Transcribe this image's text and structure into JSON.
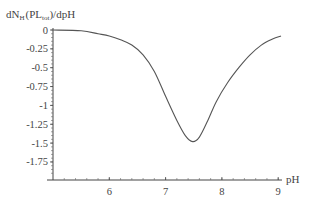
{
  "chart_data": {
    "type": "line",
    "title": "",
    "ylabel": "dN_H(PL_tot)/dpH",
    "ylabel_main": "dN",
    "ylabel_sub": "H",
    "ylabel_mid": "(PL",
    "ylabel_sub2": "tot",
    "ylabel_end": ")/dpH",
    "xlabel": "pH",
    "xlim": [
      5.0,
      9.1
    ],
    "ylim": [
      -2.0,
      0
    ],
    "xticks": [
      "6",
      "7",
      "8",
      "9"
    ],
    "yticks": [
      "0",
      "-0.25",
      "-0.5",
      "-0.75",
      "-1",
      "-1.25",
      "-1.5",
      "-1.75"
    ],
    "grid": false,
    "legend": null,
    "series": [
      {
        "name": "dN_H/dpH",
        "x": [
          5.0,
          5.5,
          5.8,
          6.0,
          6.2,
          6.4,
          6.6,
          6.8,
          7.0,
          7.2,
          7.35,
          7.48,
          7.6,
          7.75,
          7.9,
          8.1,
          8.3,
          8.5,
          8.7,
          8.9,
          9.05
        ],
        "y": [
          0.0,
          -0.01,
          -0.05,
          -0.08,
          -0.13,
          -0.2,
          -0.33,
          -0.55,
          -0.88,
          -1.2,
          -1.4,
          -1.48,
          -1.42,
          -1.2,
          -0.95,
          -0.7,
          -0.5,
          -0.33,
          -0.2,
          -0.12,
          -0.08
        ]
      }
    ]
  }
}
